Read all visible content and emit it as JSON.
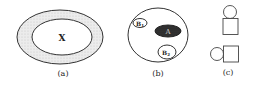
{
  "figures": [
    {
      "id": "a",
      "caption": "(a)",
      "inner_label": "X"
    },
    {
      "id": "b",
      "caption": "(b)",
      "labels": {
        "b1": "B",
        "b1_sub": "1",
        "a": "A",
        "b2": "B",
        "b2_sub": "2"
      }
    },
    {
      "id": "c",
      "caption": "(c)"
    }
  ],
  "colors": {
    "stroke": "#333333",
    "annulus_fill": "#e6e6e6",
    "dark_fill": "#2a2a2a",
    "a_label": "#d0d0d0"
  }
}
